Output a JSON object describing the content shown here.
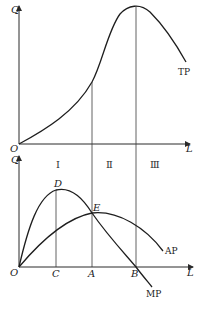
{
  "figure": {
    "top_panel": {
      "y_label": "Q",
      "origin_label": "O",
      "x_label": "L",
      "curve_label": "TP"
    },
    "bottom_panel": {
      "y_label": "Q",
      "origin_label": "O",
      "x_label": "L",
      "stages": [
        "Ⅰ",
        "Ⅱ",
        "Ⅲ"
      ],
      "points": {
        "peak_mp": "D",
        "intersection": "E"
      },
      "x_ticks": [
        "C",
        "A",
        "B"
      ],
      "curve_labels": {
        "ap": "AP",
        "mp": "MP"
      }
    }
  },
  "colors": {
    "line": "#1e1e1e",
    "background": "#ffffff"
  }
}
